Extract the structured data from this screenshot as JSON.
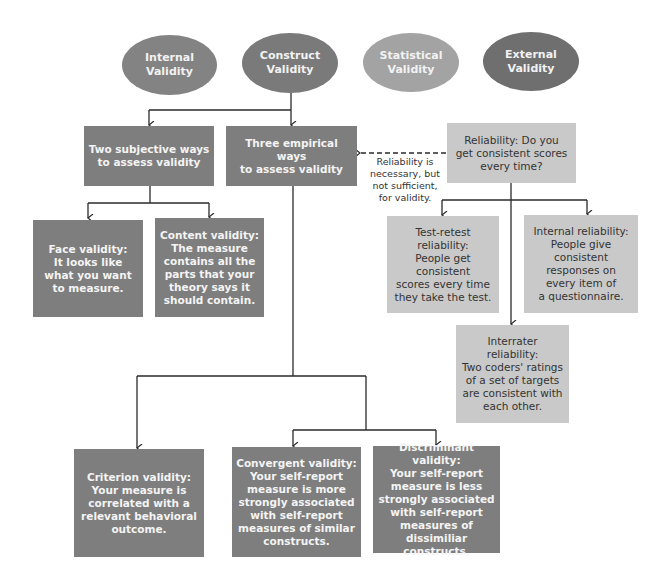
{
  "colors": {
    "internal_oval": "#838383",
    "construct_oval": "#7a7a7a",
    "statistical_oval": "#a3a3a3",
    "external_oval": "#6f6f6f",
    "dark_box": "#7e7e7e",
    "light_box": "#c9c9c9",
    "line": "#2a2a2a"
  },
  "ovals": [
    {
      "label": "Internal\nValidity"
    },
    {
      "label": "Construct\nValidity"
    },
    {
      "label": "Statistical\nValidity"
    },
    {
      "label": "External\nValidity"
    }
  ],
  "subjective": {
    "header": "Two subjective ways\nto assess validity",
    "face": "Face validity:\nIt looks like\nwhat you want\nto measure.",
    "content": "Content validity:\nThe measure\ncontains all the\nparts that your\ntheory says it\nshould contain."
  },
  "empirical": {
    "header": "Three empirical ways\nto assess validity",
    "criterion": "Criterion validity:\nYour measure is\ncorrelated with a\nrelevant behavioral\noutcome.",
    "convergent": "Convergent validity:\nYour self-report\nmeasure is more\nstrongly associated\nwith self-report\nmeasures of similar\nconstructs.",
    "discriminant": "Discriminant validity:\nYour self-report\nmeasure is less\nstrongly associated\nwith self-report\nmeasures of\ndissimiliar constructs."
  },
  "reliability": {
    "header": "Reliability: Do you\nget consistent scores\nevery time?",
    "note": "Reliability is\nnecessary, but\nnot sufficient,\nfor validity.",
    "test_retest": "Test-retest\nreliability:\nPeople get\nconsistent\nscores every time\nthey take the test.",
    "internal": "Internal reliability:\nPeople give\nconsistent\nresponses on\nevery item of\na questionnaire.",
    "interrater": "Interrater\nreliability:\nTwo coders' ratings\nof a set of targets\nare consistent with\neach other."
  }
}
